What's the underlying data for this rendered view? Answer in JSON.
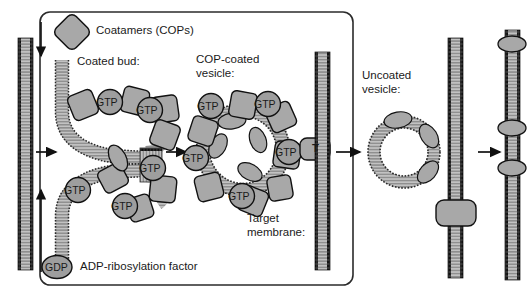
{
  "figure": {
    "box_label": "Coatamers (COPs)",
    "legend_gdp": {
      "badge": "GDP",
      "label": "ADP-ribosylation factor"
    }
  },
  "labels": {
    "coated_bud": "Coated bud:",
    "cop_coated_vesicle_line1": "COP-coated",
    "cop_coated_vesicle_line2": "vesicle:",
    "uncoated_vesicle_line1": "Uncoated",
    "uncoated_vesicle_line2": "vesicle:",
    "target_membrane_line1": "Target",
    "target_membrane_line2": "membrane:",
    "t_snare": "T",
    "gtp": "GTP"
  },
  "gtp_badges": {
    "coated_bud": [
      "GTP",
      "GTP",
      "GTP",
      "GTP",
      "GTP"
    ],
    "cop_vesicle": [
      "GTP",
      "GTP",
      "GTP",
      "GTP",
      "GTP"
    ]
  },
  "colors": {
    "outline": "#1a1a1a",
    "coat_fill": "#a8a8a8",
    "badge_fill": "#9e9e9e",
    "membrane_fill": "#b8b8b8",
    "membrane_line": "#333333",
    "background": "#ffffff",
    "box_border": "#2b2b2b"
  },
  "stages": [
    {
      "name": "donor-membrane",
      "caption": ""
    },
    {
      "name": "coated-bud",
      "caption": "Coated bud:"
    },
    {
      "name": "cop-coated-vesicle",
      "caption": "COP-coated vesicle:"
    },
    {
      "name": "uncoated-vesicle",
      "caption": "Uncoated vesicle:"
    },
    {
      "name": "fused-membrane",
      "caption": ""
    }
  ]
}
